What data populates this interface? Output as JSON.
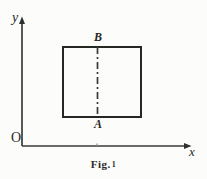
{
  "figure": {
    "caption_prefix": "Fig.",
    "caption_number": "1",
    "background_color": "#fcfcfa",
    "ink_color": "#262624"
  },
  "axes": {
    "y_label": "y",
    "x_label": "x",
    "origin_label": "O",
    "y_axis": {
      "x": 22,
      "top": 18,
      "bottom": 146,
      "arrow": "up"
    },
    "x_axis": {
      "y": 146,
      "left": 22,
      "right": 191,
      "arrow": "right"
    },
    "x_tick": {
      "x": 97
    }
  },
  "shapes": {
    "rectangle": {
      "name": "rectangle",
      "left": 63,
      "top": 47,
      "right": 141,
      "bottom": 117,
      "stroke_color": "#262624",
      "stroke_width": 2
    },
    "center_line": {
      "name": "dash-dot-center-line",
      "x": 97,
      "top": 47,
      "bottom": 117,
      "dash_pattern": "7,3,2,3",
      "stroke_color": "#3a3a38",
      "stroke_width": 1.6
    }
  },
  "points": [
    {
      "id": "B",
      "label": "B",
      "position": "top-center",
      "x": 97,
      "y": 47
    },
    {
      "id": "A",
      "label": "A",
      "position": "bottom-center",
      "x": 97,
      "y": 117
    }
  ]
}
